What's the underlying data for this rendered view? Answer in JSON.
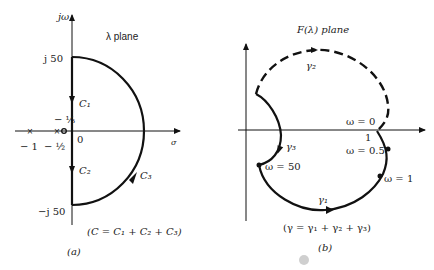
{
  "panel_a": {
    "caption": "(a)",
    "plane_label": "λ plane",
    "y_axis_label": "jω",
    "x_axis_label": "σ",
    "ticks": {
      "top": "j 50",
      "bottom": "−j 50",
      "origin": "0",
      "neg_one": "− 1",
      "neg_half": "− ½",
      "neg_third": "− ⅓"
    },
    "contours": {
      "c1": "C₁",
      "c2": "C₂",
      "c3": "C₃"
    },
    "equation": "(C = C₁ + C₂ + C₃)"
  },
  "panel_b": {
    "caption": "(b)",
    "plane_label": "F(λ) plane",
    "contours": {
      "g1": "γ₁",
      "g2": "γ₂",
      "g3": "γ₃"
    },
    "points": {
      "w0": "ω = 0",
      "w05": "ω = 0.5",
      "w1": "ω = 1",
      "w50": "ω = 50"
    },
    "tick_one": "1",
    "equation": "(γ = γ₁ + γ₂ + γ₃)"
  }
}
